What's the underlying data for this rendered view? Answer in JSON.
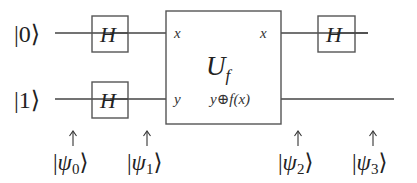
{
  "diagram": {
    "type": "quantum-circuit",
    "inputs": [
      {
        "label_prefix": "|",
        "label_value": "0",
        "label_suffix": "⟩"
      },
      {
        "label_prefix": "|",
        "label_value": "1",
        "label_suffix": "⟩"
      }
    ],
    "gates": {
      "h_top_left": "H",
      "h_bottom_left": "H",
      "h_top_right": "H"
    },
    "oracle": {
      "label": "U",
      "subscript": "f",
      "input_top": "x",
      "input_bottom": "y",
      "output_top": "x",
      "output_bottom": "y⊕f(x)"
    },
    "states": [
      {
        "arrow": "↑",
        "prefix": "|",
        "symbol": "ψ",
        "sub": "0",
        "suffix": "⟩"
      },
      {
        "arrow": "↑",
        "prefix": "|",
        "symbol": "ψ",
        "sub": "1",
        "suffix": "⟩"
      },
      {
        "arrow": "↑",
        "prefix": "|",
        "symbol": "ψ",
        "sub": "2",
        "suffix": "⟩"
      },
      {
        "arrow": "↑",
        "prefix": "|",
        "symbol": "ψ",
        "sub": "3",
        "suffix": "⟩"
      }
    ]
  }
}
